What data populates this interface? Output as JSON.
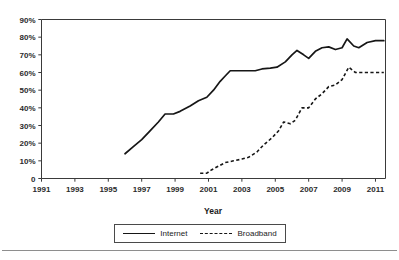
{
  "chart_data": {
    "type": "line",
    "title": "",
    "xlabel": "Year",
    "ylabel": "",
    "xlim": [
      1991,
      2011.6
    ],
    "ylim": [
      0,
      90
    ],
    "grid": false,
    "legend_position": "bottom-center",
    "x_tick_labels": [
      "1991",
      "1993",
      "1995",
      "1997",
      "1999",
      "2001",
      "2003",
      "2005",
      "2007",
      "2009",
      "2011"
    ],
    "x_tick_values": [
      1991,
      1993,
      1995,
      1997,
      1999,
      2001,
      2003,
      2005,
      2007,
      2009,
      2011
    ],
    "y_tick_labels": [
      "0",
      "10%",
      "20%",
      "30%",
      "40%",
      "50%",
      "60%",
      "70%",
      "80%",
      "90%"
    ],
    "y_tick_values": [
      0,
      10,
      20,
      30,
      40,
      50,
      60,
      70,
      80,
      90
    ],
    "series": [
      {
        "name": "Internet",
        "style": "solid",
        "color": "#161616",
        "points": [
          [
            1996.0,
            14
          ],
          [
            1996.5,
            18
          ],
          [
            1997.0,
            22
          ],
          [
            1997.5,
            27
          ],
          [
            1998.0,
            32
          ],
          [
            1998.4,
            36.5
          ],
          [
            1998.9,
            36.5
          ],
          [
            1999.3,
            38
          ],
          [
            1999.9,
            41
          ],
          [
            2000.4,
            44
          ],
          [
            2000.9,
            46
          ],
          [
            2001.3,
            50
          ],
          [
            2001.7,
            55
          ],
          [
            2002.0,
            58
          ],
          [
            2002.3,
            61
          ],
          [
            2002.8,
            61
          ],
          [
            2003.3,
            61
          ],
          [
            2003.8,
            61
          ],
          [
            2004.2,
            62
          ],
          [
            2004.7,
            62.5
          ],
          [
            2005.1,
            63
          ],
          [
            2005.6,
            66
          ],
          [
            2006.0,
            70
          ],
          [
            2006.3,
            72.5
          ],
          [
            2006.7,
            70
          ],
          [
            2007.0,
            68
          ],
          [
            2007.4,
            72
          ],
          [
            2007.8,
            74
          ],
          [
            2008.2,
            74.5
          ],
          [
            2008.6,
            73
          ],
          [
            2009.0,
            74
          ],
          [
            2009.3,
            79
          ],
          [
            2009.7,
            75
          ],
          [
            2010.0,
            74
          ],
          [
            2010.5,
            77
          ],
          [
            2011.0,
            78
          ],
          [
            2011.5,
            78
          ]
        ]
      },
      {
        "name": "Broadband",
        "style": "dashed",
        "color": "#161616",
        "points": [
          [
            2000.5,
            3
          ],
          [
            2000.9,
            3
          ],
          [
            2001.2,
            5
          ],
          [
            2001.6,
            7
          ],
          [
            2002.0,
            9
          ],
          [
            2002.5,
            10
          ],
          [
            2003.0,
            11
          ],
          [
            2003.4,
            12
          ],
          [
            2003.9,
            15
          ],
          [
            2004.3,
            19
          ],
          [
            2004.8,
            23
          ],
          [
            2005.2,
            27
          ],
          [
            2005.5,
            32
          ],
          [
            2005.9,
            31
          ],
          [
            2006.2,
            33
          ],
          [
            2006.6,
            40
          ],
          [
            2007.0,
            40
          ],
          [
            2007.4,
            45
          ],
          [
            2007.8,
            48
          ],
          [
            2008.2,
            52
          ],
          [
            2008.6,
            53
          ],
          [
            2009.0,
            56
          ],
          [
            2009.4,
            63
          ],
          [
            2009.8,
            60
          ],
          [
            2010.3,
            60
          ],
          [
            2011.0,
            60
          ],
          [
            2011.5,
            60
          ]
        ]
      }
    ]
  },
  "legend": {
    "entries": [
      {
        "label": "Internet",
        "style": "solid"
      },
      {
        "label": "Broadband",
        "style": "dashed"
      }
    ]
  }
}
